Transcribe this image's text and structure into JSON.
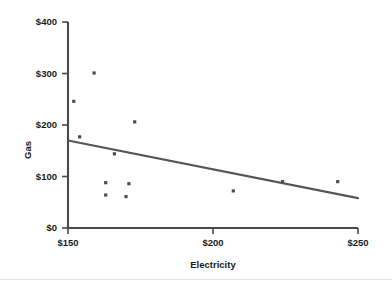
{
  "chart_data": {
    "type": "scatter",
    "title": "",
    "xlabel": "Electricity",
    "ylabel": "Gas",
    "xlim": [
      150,
      250
    ],
    "ylim": [
      0,
      400
    ],
    "grid": false,
    "legend": null,
    "x_ticks": [
      150,
      200,
      250
    ],
    "y_ticks": [
      0,
      100,
      200,
      300,
      400
    ],
    "x_tick_labels": [
      "$150",
      "$200",
      "$250"
    ],
    "y_tick_labels": [
      "$0",
      "$100",
      "$200",
      "$300",
      "$400"
    ],
    "points": [
      {
        "x": 152,
        "y": 246
      },
      {
        "x": 159,
        "y": 301
      },
      {
        "x": 154,
        "y": 177
      },
      {
        "x": 166,
        "y": 144
      },
      {
        "x": 173,
        "y": 206
      },
      {
        "x": 163,
        "y": 88
      },
      {
        "x": 171,
        "y": 86
      },
      {
        "x": 170,
        "y": 61
      },
      {
        "x": 163,
        "y": 64
      },
      {
        "x": 207,
        "y": 72
      },
      {
        "x": 224,
        "y": 90
      },
      {
        "x": 243,
        "y": 90
      }
    ],
    "trend_line": {
      "label": "linear fit",
      "x_start": 150,
      "y_start": 170,
      "x_end": 250,
      "y_end": 58,
      "color": "#555555"
    },
    "colors": {
      "point": "#4d4d4d",
      "axis": "#4a4a4a",
      "text": "#1a1a1a",
      "background": "#ffffff"
    }
  }
}
